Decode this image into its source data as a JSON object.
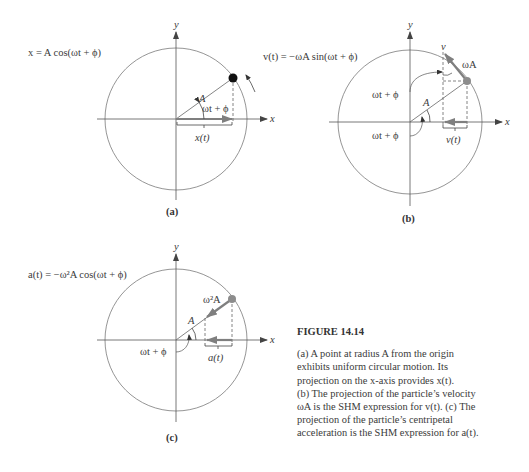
{
  "figure": {
    "title": "FIGURE 14.14",
    "caption": "(a) A point at radius A from the origin exhibits uniform circular motion. Its projection on the x-axis provides x(t). (b) The projection of the particle’s velocity ωA is the SHM expression for v(t). (c) The projection of the particle’s centripetal acceleration is the SHM expression for a(t).",
    "caption_lines": [
      "(a) A point at radius A from the origin",
      "exhibits uniform circular motion. Its",
      "projection on the x-axis provides x(t).",
      "(b) The projection of the particle’s velocity",
      "ωA is the SHM expression for v(t). (c) The",
      "projection of the particle’s centripetal",
      "acceleration is the SHM expression for a(t)."
    ]
  },
  "panels": {
    "a": {
      "label": "(a)",
      "equation": "x = A cos(ωt + ϕ)",
      "axis_x": "x",
      "axis_y": "y",
      "radius_label": "A",
      "angle_label": "ωt + ϕ",
      "projection_label": "x(t)"
    },
    "b": {
      "label": "(b)",
      "equation": "v(t) = −ωA sin(ωt + ϕ)",
      "axis_x": "x",
      "axis_y": "y",
      "radius_label": "A",
      "angle_label_top": "ωt + ϕ",
      "angle_label_bottom": "ωt + ϕ",
      "vector_label": "ωA",
      "vertical_label": "v",
      "projection_label": "v(t)"
    },
    "c": {
      "label": "(c)",
      "equation": "a(t) = −ω²A cos(ωt + ϕ)",
      "axis_x": "x",
      "axis_y": "y",
      "radius_label": "A",
      "angle_label": "ωt + ϕ",
      "vector_label": "ω²A",
      "projection_label": "a(t)"
    }
  },
  "colors": {
    "line": "#555555",
    "circle": "#7a7a7a",
    "vector": "#7f7f7f",
    "point_a": "#111111",
    "point_bc": "#8c8c8c"
  }
}
